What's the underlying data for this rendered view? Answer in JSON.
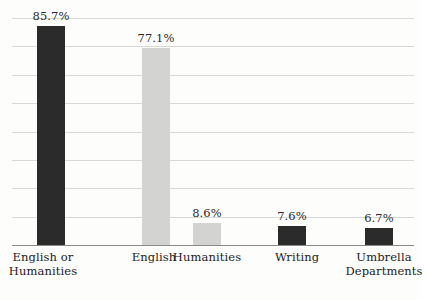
{
  "chart_data": {
    "type": "bar",
    "title": "",
    "subtitle": "",
    "xlabel": "",
    "ylabel": "",
    "ylim": [
      0,
      90
    ],
    "grid": true,
    "legend": "none",
    "gridline_interval": 10,
    "gridline_count": 8,
    "categories": [
      "English or\nHumanities",
      "English",
      "Humanities",
      "Writing",
      "Umbrella\nDepartments"
    ],
    "values": [
      85.7,
      77.1,
      8.6,
      7.6,
      6.7
    ],
    "value_labels": [
      "85.7%",
      "77.1%",
      "8.6%",
      "7.6%",
      "6.7%"
    ],
    "bar_colors": [
      "#2b2b2b",
      "#d3d3d1",
      "#d3d3d1",
      "#2b2b2b",
      "#2b2b2b"
    ]
  },
  "colors": {
    "background": "#fdfdfc",
    "dark_bar": "#2b2b2b",
    "light_bar": "#d3d3d1",
    "gridline": "#d8d8d6",
    "axis": "#8a8a88",
    "text": "#222222"
  },
  "bars": [
    {
      "value_label": "85.7%",
      "category": "English or\nHumanities",
      "color_key": "dark"
    },
    {
      "value_label": "77.1%",
      "category": "English",
      "color_key": "light"
    },
    {
      "value_label": "8.6%",
      "category": "Humanities",
      "color_key": "light"
    },
    {
      "value_label": "7.6%",
      "category": "Writing",
      "color_key": "dark"
    },
    {
      "value_label": "6.7%",
      "category": "Umbrella\nDepartments",
      "color_key": "dark"
    }
  ]
}
